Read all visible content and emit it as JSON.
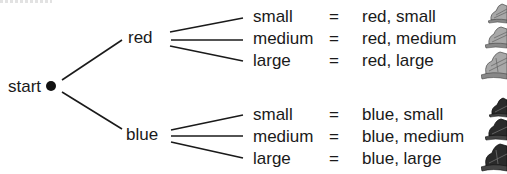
{
  "diagram": {
    "type": "tree",
    "root": {
      "label": "start"
    },
    "branches": [
      {
        "label": "red",
        "children": [
          {
            "size": "small",
            "equals": "=",
            "outcome": "red, small",
            "icon": "hat-light-small"
          },
          {
            "size": "medium",
            "equals": "=",
            "outcome": "red, medium",
            "icon": "hat-light-medium"
          },
          {
            "size": "large",
            "equals": "=",
            "outcome": "red, large",
            "icon": "hat-light-large"
          }
        ]
      },
      {
        "label": "blue",
        "children": [
          {
            "size": "small",
            "equals": "=",
            "outcome": "blue, small",
            "icon": "hat-dark-small"
          },
          {
            "size": "medium",
            "equals": "=",
            "outcome": "blue, medium",
            "icon": "hat-dark-medium"
          },
          {
            "size": "large",
            "equals": "=",
            "outcome": "blue, large",
            "icon": "hat-dark-large"
          }
        ]
      }
    ],
    "colors": {
      "line": "#1a1a1a",
      "text": "#1a1a1a",
      "background": "#ffffff",
      "hat_light": "#9a9a9a",
      "hat_dark": "#2a2a2a"
    }
  }
}
